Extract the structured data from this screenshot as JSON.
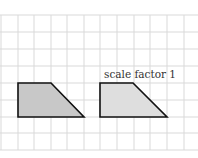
{
  "diagram": {
    "grid": {
      "color": "#d9d9d9",
      "x_lines": [
        1,
        18,
        34,
        51,
        67,
        84,
        100,
        117,
        134,
        150,
        167,
        184
      ],
      "y_lines": [
        15,
        32,
        49,
        66,
        83,
        100,
        117,
        133,
        150
      ]
    },
    "shapes": [
      {
        "name": "original-trapezoid",
        "points": "18,83 51,83 84,117 18,117",
        "fill": "#c8c8c8",
        "stroke": "#111111"
      },
      {
        "name": "image-trapezoid",
        "points": "100,83 133,83 167,117 100,117",
        "fill": "#dedede",
        "stroke": "#111111"
      }
    ],
    "label": {
      "text": "scale factor 1",
      "x": 104,
      "y": 78
    }
  }
}
